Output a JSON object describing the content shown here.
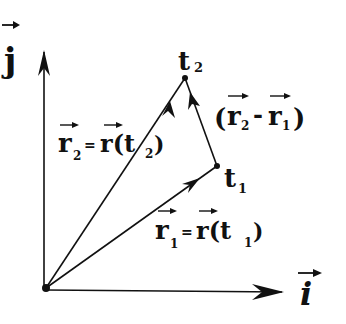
{
  "diagram": {
    "type": "vector-displacement",
    "axes": {
      "x_label": "i",
      "y_label": "j"
    },
    "points": {
      "origin": {
        "x": 46,
        "y": 288
      },
      "t1": {
        "label": "t",
        "sub": "1",
        "x": 217,
        "y": 166
      },
      "t2": {
        "label": "t",
        "sub": "2",
        "x": 185,
        "y": 78
      }
    },
    "labels": {
      "r2_eq": {
        "lhs": "r",
        "lhs_sub": "2",
        "eq": "=",
        "rhs": "r(t",
        "rhs_sub": "2",
        "close": ")"
      },
      "r1_eq": {
        "lhs": "r",
        "lhs_sub": "1",
        "eq": "=",
        "rhs": "r(t",
        "rhs_sub": "1",
        "close": ")"
      },
      "diff": {
        "open": "(",
        "a": "r",
        "a_sub": "2",
        "minus": "-",
        "b": "r",
        "b_sub": "1",
        "close": ")"
      }
    },
    "colors": {
      "ink": "#111111",
      "background": "#ffffff"
    }
  }
}
